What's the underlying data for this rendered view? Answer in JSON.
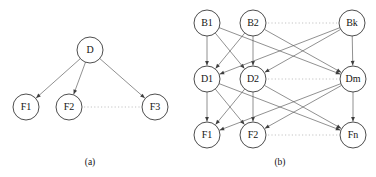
{
  "figure": {
    "width": 376,
    "height": 177,
    "background": "#ffffff",
    "node_fill": "#ffffff",
    "node_stroke": "#3a3a3a",
    "edge_color": "#555555",
    "ellipsis_color": "#b5b5b5",
    "text_color": "#141414"
  },
  "panels": [
    {
      "id": "panel-a",
      "caption": "(a)",
      "caption_pos": {
        "x": 90,
        "y": 163
      },
      "node_radius": 13,
      "nodes": [
        {
          "id": "D",
          "label": "D",
          "x": 90,
          "y": 50,
          "layer": "cause"
        },
        {
          "id": "F1",
          "label": "F1",
          "x": 26,
          "y": 107,
          "layer": "effect"
        },
        {
          "id": "F2",
          "label": "F2",
          "x": 69,
          "y": 107,
          "layer": "effect"
        },
        {
          "id": "F3",
          "label": "F3",
          "x": 155,
          "y": 107,
          "layer": "effect"
        }
      ],
      "edges": [
        {
          "from": "D",
          "to": "F1"
        },
        {
          "from": "D",
          "to": "F2"
        },
        {
          "from": "D",
          "to": "F3"
        }
      ],
      "ellipses": [
        {
          "from": "F2",
          "to": "F3",
          "y": 107
        }
      ]
    },
    {
      "id": "panel-b",
      "caption": "(b)",
      "caption_pos": {
        "x": 280,
        "y": 163
      },
      "node_radius": 13,
      "nodes": [
        {
          "id": "B1",
          "label": "B1",
          "x": 207,
          "y": 23,
          "layer": "B"
        },
        {
          "id": "B2",
          "label": "B2",
          "x": 253,
          "y": 23,
          "layer": "B"
        },
        {
          "id": "Bk",
          "label": "Bk",
          "x": 352,
          "y": 23,
          "layer": "B"
        },
        {
          "id": "D1",
          "label": "D1",
          "x": 207,
          "y": 79,
          "layer": "D"
        },
        {
          "id": "D2",
          "label": "D2",
          "x": 253,
          "y": 79,
          "layer": "D"
        },
        {
          "id": "Dm",
          "label": "Dm",
          "x": 353,
          "y": 79,
          "layer": "D"
        },
        {
          "id": "F1",
          "label": "F1",
          "x": 207,
          "y": 135,
          "layer": "F"
        },
        {
          "id": "F2",
          "label": "F2",
          "x": 253,
          "y": 135,
          "layer": "F"
        },
        {
          "id": "Fn",
          "label": "Fn",
          "x": 353,
          "y": 135,
          "layer": "F"
        }
      ],
      "edges": [
        {
          "from": "B1",
          "to": "D1"
        },
        {
          "from": "B1",
          "to": "D2"
        },
        {
          "from": "B1",
          "to": "Dm"
        },
        {
          "from": "B2",
          "to": "D1"
        },
        {
          "from": "B2",
          "to": "D2"
        },
        {
          "from": "B2",
          "to": "Dm"
        },
        {
          "from": "Bk",
          "to": "D1"
        },
        {
          "from": "Bk",
          "to": "D2"
        },
        {
          "from": "Bk",
          "to": "Dm"
        },
        {
          "from": "D1",
          "to": "F1"
        },
        {
          "from": "D1",
          "to": "F2"
        },
        {
          "from": "D1",
          "to": "Fn"
        },
        {
          "from": "D2",
          "to": "F1"
        },
        {
          "from": "D2",
          "to": "F2"
        },
        {
          "from": "D2",
          "to": "Fn"
        },
        {
          "from": "Dm",
          "to": "F1"
        },
        {
          "from": "Dm",
          "to": "F2"
        },
        {
          "from": "Dm",
          "to": "Fn"
        }
      ],
      "ellipses": [
        {
          "from": "B2",
          "to": "Bk",
          "y": 23
        },
        {
          "from": "D2",
          "to": "Dm",
          "y": 79
        },
        {
          "from": "F2",
          "to": "Fn",
          "y": 135
        }
      ]
    }
  ]
}
